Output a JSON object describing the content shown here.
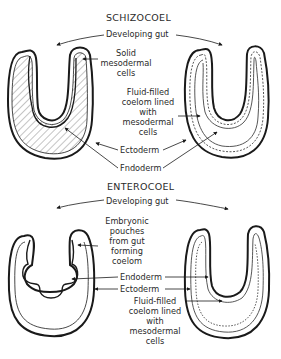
{
  "schizocoel": {
    "title": "SCHIZOCOEL",
    "gut_label": "Developing gut",
    "solid": [
      "Solid",
      "mesodermal",
      "cells"
    ],
    "fluid": [
      "Fluid-filled",
      "coelom lined",
      "with",
      "mesodermal",
      "cells"
    ],
    "ectoderm": "Ectoderm",
    "endoderm": "Fndoderm"
  },
  "enterocoel": {
    "title": "ENTEROCOEL",
    "gut_label": "Developing gut",
    "pouches": [
      "Embryonic",
      "pouches",
      "from gut",
      "forming",
      "coelom"
    ],
    "endoderm": "Endoderm",
    "ectoderm": "Ectoderm",
    "fluid": [
      "Fluid-filled",
      "coelom lined",
      "with",
      "mesodermal",
      "cells"
    ]
  },
  "colors": {
    "ink": "#1a1a1a",
    "background": "#ffffff"
  }
}
